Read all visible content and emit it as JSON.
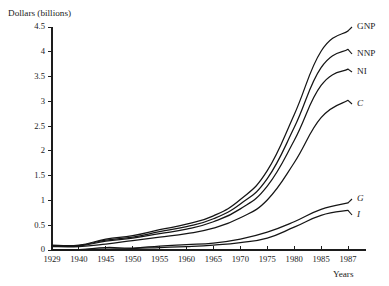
{
  "chart_data": {
    "type": "line",
    "title": "",
    "ylabel": "Dollars (billions)",
    "xlabel": "Years",
    "ylim": [
      0,
      4.5
    ],
    "yticks": [
      "0",
      "0.5",
      "1",
      "1.5",
      "2",
      "2.5",
      "3",
      "3.5",
      "4",
      "4.5"
    ],
    "ytick_values": [
      0,
      0.5,
      1,
      1.5,
      2,
      2.5,
      3,
      3.5,
      4,
      4.5
    ],
    "grid": false,
    "legend_position": "right-inline-labels",
    "x": [
      1929,
      1940,
      1945,
      1950,
      1955,
      1960,
      1965,
      1970,
      1975,
      1980,
      1985,
      1987
    ],
    "xtick_labels": [
      "1929",
      "1940",
      "1945",
      "1950",
      "1955",
      "1960",
      "1965",
      "1970",
      "1975",
      "1980",
      "1985",
      "1987"
    ],
    "series": [
      {
        "name": "GNP",
        "label": "GNP",
        "italic": false,
        "values": [
          0.1,
          0.1,
          0.22,
          0.29,
          0.41,
          0.52,
          0.69,
          1.02,
          1.6,
          2.73,
          4.01,
          4.42
        ]
      },
      {
        "name": "NNP",
        "label": "NNP",
        "italic": false,
        "values": [
          0.09,
          0.09,
          0.2,
          0.26,
          0.37,
          0.47,
          0.63,
          0.93,
          1.44,
          2.47,
          3.68,
          4.05
        ]
      },
      {
        "name": "NI",
        "label": "NI",
        "italic": false,
        "values": [
          0.08,
          0.08,
          0.18,
          0.24,
          0.33,
          0.42,
          0.57,
          0.83,
          1.29,
          2.21,
          3.32,
          3.65
        ]
      },
      {
        "name": "C",
        "label": "C",
        "italic": true,
        "values": [
          0.07,
          0.07,
          0.12,
          0.19,
          0.26,
          0.33,
          0.44,
          0.65,
          1.01,
          1.76,
          2.67,
          3.02
        ]
      },
      {
        "name": "G",
        "label": "G",
        "italic": true,
        "values": [
          0.01,
          0.01,
          0.05,
          0.04,
          0.08,
          0.11,
          0.14,
          0.22,
          0.36,
          0.57,
          0.82,
          0.95
        ]
      },
      {
        "name": "I",
        "label": "I",
        "italic": true,
        "values": [
          0.01,
          0.01,
          0.02,
          0.03,
          0.05,
          0.07,
          0.1,
          0.15,
          0.24,
          0.46,
          0.7,
          0.8
        ]
      }
    ]
  },
  "axis": {
    "y_title": "Dollars (billions)",
    "x_title": "Years"
  }
}
